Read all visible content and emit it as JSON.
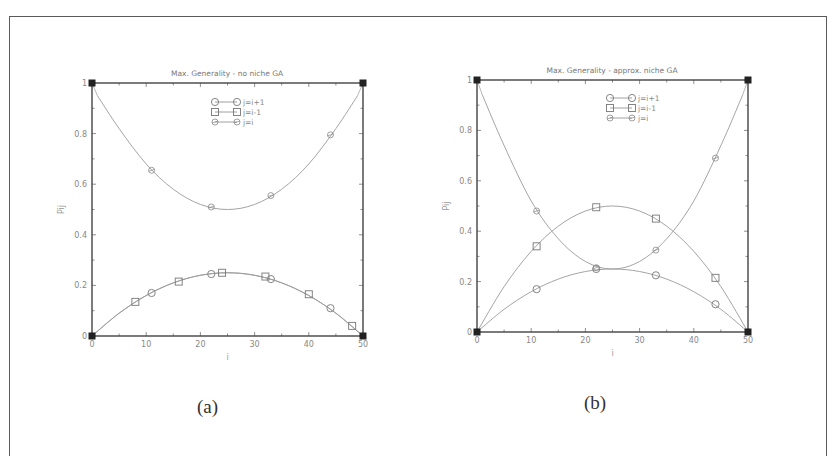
{
  "figure": {
    "captions": [
      "(a)",
      "(b)"
    ]
  },
  "chart_data": [
    {
      "type": "line",
      "panel": "(a)",
      "title": "Max. Generality - no niche GA",
      "xlabel": "i",
      "ylabel": "P_ij",
      "xlim": [
        0,
        50
      ],
      "ylim": [
        0,
        1
      ],
      "xticks": [
        0,
        10,
        20,
        30,
        40,
        50
      ],
      "yticks": [
        0,
        0.2,
        0.4,
        0.6,
        0.8,
        1
      ],
      "ytick_labels": [
        "0",
        "0.2",
        "0.4",
        "0.6",
        "0.8",
        "1"
      ],
      "grid": false,
      "legend_position": "upper center",
      "legend": [
        "j=i+1",
        "j=i-1",
        "j=i"
      ],
      "series": [
        {
          "name": "j=i+1",
          "marker": "circle",
          "curve": [
            [
              0,
              0
            ],
            [
              5,
              0.09
            ],
            [
              10,
              0.16
            ],
            [
              15,
              0.21
            ],
            [
              20,
              0.24
            ],
            [
              25,
              0.25
            ],
            [
              30,
              0.24
            ],
            [
              35,
              0.21
            ],
            [
              40,
              0.16
            ],
            [
              45,
              0.09
            ],
            [
              50,
              0
            ]
          ],
          "points": [
            [
              11,
              0.17
            ],
            [
              22,
              0.245
            ],
            [
              33,
              0.225
            ],
            [
              44,
              0.11
            ]
          ]
        },
        {
          "name": "j=i-1",
          "marker": "square",
          "curve": [
            [
              0,
              0
            ],
            [
              5,
              0.09
            ],
            [
              10,
              0.16
            ],
            [
              15,
              0.21
            ],
            [
              20,
              0.24
            ],
            [
              25,
              0.25
            ],
            [
              30,
              0.24
            ],
            [
              35,
              0.21
            ],
            [
              40,
              0.16
            ],
            [
              45,
              0.09
            ],
            [
              50,
              0
            ]
          ],
          "points": [
            [
              8,
              0.135
            ],
            [
              16,
              0.215
            ],
            [
              24,
              0.25
            ],
            [
              32,
              0.235
            ],
            [
              40,
              0.165
            ],
            [
              48,
              0.04
            ]
          ]
        },
        {
          "name": "j=i",
          "marker": "diamond",
          "curve": [
            [
              1,
              0.95
            ],
            [
              5,
              0.82
            ],
            [
              10,
              0.68
            ],
            [
              15,
              0.58
            ],
            [
              20,
              0.52
            ],
            [
              25,
              0.5
            ],
            [
              30,
              0.52
            ],
            [
              35,
              0.58
            ],
            [
              40,
              0.68
            ],
            [
              45,
              0.82
            ],
            [
              49,
              0.95
            ]
          ],
          "points": [
            [
              11,
              0.655
            ],
            [
              22,
              0.51
            ],
            [
              33,
              0.555
            ],
            [
              44,
              0.795
            ]
          ]
        }
      ],
      "corner_markers": [
        [
          0,
          0
        ],
        [
          0,
          1
        ],
        [
          50,
          0
        ],
        [
          50,
          1
        ]
      ]
    },
    {
      "type": "line",
      "panel": "(b)",
      "title": "Max. Generality - approx. niche GA",
      "xlabel": "i",
      "ylabel": "P_ij",
      "xlim": [
        0,
        50
      ],
      "ylim": [
        0,
        1
      ],
      "xticks": [
        0,
        10,
        20,
        30,
        40,
        50
      ],
      "yticks": [
        0,
        0.2,
        0.4,
        0.6,
        0.8,
        1
      ],
      "ytick_labels": [
        "0",
        "0.2",
        "0.4",
        "0.6",
        "0.8",
        "1"
      ],
      "grid": false,
      "legend_position": "upper center",
      "legend": [
        "j=i+1",
        "j=i-1",
        "j=i"
      ],
      "series": [
        {
          "name": "j=i+1",
          "marker": "circle",
          "curve": [
            [
              0,
              0
            ],
            [
              5,
              0.09
            ],
            [
              10,
              0.16
            ],
            [
              15,
              0.21
            ],
            [
              20,
              0.24
            ],
            [
              25,
              0.25
            ],
            [
              30,
              0.24
            ],
            [
              35,
              0.21
            ],
            [
              40,
              0.16
            ],
            [
              45,
              0.09
            ],
            [
              50,
              0
            ]
          ],
          "points": [
            [
              11,
              0.17
            ],
            [
              22,
              0.25
            ],
            [
              33,
              0.225
            ],
            [
              44,
              0.11
            ]
          ]
        },
        {
          "name": "j=i-1",
          "marker": "square",
          "curve": [
            [
              0,
              0
            ],
            [
              5,
              0.18
            ],
            [
              10,
              0.32
            ],
            [
              15,
              0.42
            ],
            [
              20,
              0.48
            ],
            [
              25,
              0.5
            ],
            [
              30,
              0.48
            ],
            [
              35,
              0.42
            ],
            [
              40,
              0.32
            ],
            [
              45,
              0.18
            ],
            [
              50,
              0
            ]
          ],
          "points": [
            [
              11,
              0.34
            ],
            [
              22,
              0.495
            ],
            [
              33,
              0.45
            ],
            [
              44,
              0.215
            ]
          ]
        },
        {
          "name": "j=i",
          "marker": "diamond",
          "curve": [
            [
              1,
              0.94
            ],
            [
              5,
              0.74
            ],
            [
              10,
              0.52
            ],
            [
              15,
              0.37
            ],
            [
              20,
              0.28
            ],
            [
              25,
              0.25
            ],
            [
              30,
              0.28
            ],
            [
              35,
              0.37
            ],
            [
              40,
              0.52
            ],
            [
              45,
              0.74
            ],
            [
              49,
              0.94
            ]
          ],
          "points": [
            [
              11,
              0.48
            ],
            [
              22,
              0.255
            ],
            [
              33,
              0.325
            ],
            [
              44,
              0.69
            ]
          ]
        }
      ],
      "corner_markers": [
        [
          0,
          0
        ],
        [
          0,
          1
        ],
        [
          50,
          0
        ],
        [
          50,
          1
        ]
      ]
    }
  ]
}
